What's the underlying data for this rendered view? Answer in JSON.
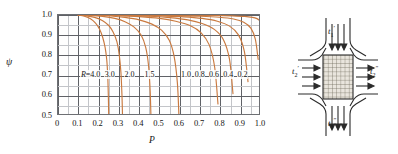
{
  "chart_data": {
    "type": "line",
    "title": "",
    "xlabel": "P",
    "ylabel": "ψ",
    "xlim": [
      0,
      1.0
    ],
    "ylim": [
      0.5,
      1.0
    ],
    "grid": true,
    "grid_major_x": 0.1,
    "grid_major_y": 0.1,
    "grid_minor_x": 0.05,
    "grid_minor_y": 0.05,
    "legend_position": "inline-curve-labels",
    "curve_color": "#c9793f",
    "x_ticks": [
      "0",
      "0.1",
      "0.2",
      "0.3",
      "0.4",
      "0.5",
      "0.6",
      "0.7",
      "0.8",
      "0.9",
      "1.0"
    ],
    "y_ticks": [
      "0.5",
      "0.6",
      "0.7",
      "0.8",
      "0.9",
      "1.0"
    ],
    "parameter_symbol": "R",
    "series": [
      {
        "name": "R=4.0",
        "label": "R=4.0",
        "label_x": 0.155,
        "label_y": 0.7,
        "x": [
          0.1,
          0.13,
          0.16,
          0.185,
          0.205,
          0.22,
          0.232,
          0.24,
          0.245,
          0.248,
          0.25
        ],
        "y": [
          1.0,
          0.994,
          0.982,
          0.96,
          0.93,
          0.89,
          0.84,
          0.78,
          0.7,
          0.6,
          0.49
        ]
      },
      {
        "name": "3.0",
        "label": "3.0",
        "label_x": 0.272,
        "label_y": 0.7,
        "x": [
          0.1,
          0.14,
          0.18,
          0.22,
          0.25,
          0.272,
          0.29,
          0.302,
          0.31,
          0.315,
          0.318
        ],
        "y": [
          1.0,
          0.996,
          0.988,
          0.972,
          0.948,
          0.915,
          0.868,
          0.8,
          0.715,
          0.605,
          0.49
        ]
      },
      {
        "name": "2.0",
        "label": "2.0",
        "label_x": 0.37,
        "label_y": 0.7,
        "x": [
          0.1,
          0.16,
          0.22,
          0.28,
          0.33,
          0.375,
          0.41,
          0.432,
          0.446,
          0.454,
          0.458
        ],
        "y": [
          1.0,
          0.998,
          0.993,
          0.983,
          0.967,
          0.94,
          0.9,
          0.84,
          0.75,
          0.625,
          0.49
        ]
      },
      {
        "name": "1.5",
        "label": "1.5",
        "label_x": 0.468,
        "label_y": 0.7,
        "x": [
          0.1,
          0.18,
          0.26,
          0.33,
          0.4,
          0.46,
          0.51,
          0.548,
          0.572,
          0.588,
          0.596
        ],
        "y": [
          1.0,
          0.999,
          0.995,
          0.988,
          0.976,
          0.956,
          0.925,
          0.875,
          0.795,
          0.665,
          0.495
        ]
      },
      {
        "name": "1.0",
        "label": "1.0",
        "label_x": 0.648,
        "label_y": 0.7,
        "x": [
          0.1,
          0.2,
          0.3,
          0.4,
          0.5,
          0.58,
          0.65,
          0.705,
          0.745,
          0.772,
          0.788
        ],
        "y": [
          1.0,
          0.999,
          0.997,
          0.992,
          0.983,
          0.969,
          0.948,
          0.912,
          0.852,
          0.74,
          0.56
        ]
      },
      {
        "name": "0.8",
        "label": "0.8",
        "label_x": 0.715,
        "label_y": 0.7,
        "x": [
          0.1,
          0.22,
          0.34,
          0.45,
          0.55,
          0.64,
          0.71,
          0.77,
          0.815,
          0.845,
          0.862
        ],
        "y": [
          1.0,
          0.999,
          0.997,
          0.994,
          0.987,
          0.976,
          0.958,
          0.929,
          0.878,
          0.78,
          0.61
        ]
      },
      {
        "name": "0.6",
        "label": "0.6",
        "label_x": 0.786,
        "label_y": 0.7,
        "x": [
          0.1,
          0.25,
          0.39,
          0.51,
          0.62,
          0.71,
          0.785,
          0.845,
          0.888,
          0.918,
          0.936
        ],
        "y": [
          1.0,
          0.999,
          0.998,
          0.995,
          0.991,
          0.983,
          0.969,
          0.945,
          0.903,
          0.82,
          0.67
        ]
      },
      {
        "name": "0.4",
        "label": "0.4",
        "label_x": 0.856,
        "label_y": 0.7,
        "x": [
          0.1,
          0.28,
          0.44,
          0.58,
          0.7,
          0.795,
          0.865,
          0.915,
          0.95,
          0.972,
          0.986
        ],
        "y": [
          1.0,
          1.0,
          0.999,
          0.997,
          0.994,
          0.989,
          0.98,
          0.964,
          0.935,
          0.88,
          0.78
        ]
      },
      {
        "name": "0.2",
        "label": "0.2",
        "label_x": 0.926,
        "label_y": 0.7,
        "x": [
          0.1,
          0.32,
          0.5,
          0.65,
          0.77,
          0.86,
          0.92,
          0.958,
          0.98,
          0.992,
          1.0
        ],
        "y": [
          1.0,
          1.0,
          1.0,
          0.999,
          0.998,
          0.996,
          0.993,
          0.988,
          0.982,
          0.974,
          0.962
        ]
      }
    ]
  },
  "diagram": {
    "name": "crossflow-heat-exchanger",
    "core_label": "finned-core-hatch",
    "streams": [
      {
        "id": "top-inlet",
        "text": "t",
        "sub": "1",
        "prime": "′",
        "x": 38,
        "y": 24
      },
      {
        "id": "left-inlet",
        "text": "t",
        "sub": "2",
        "prime": "′",
        "x": 2,
        "y": 64
      },
      {
        "id": "right-outlet",
        "text": "t",
        "sub": "2",
        "prime": "″",
        "x": 80,
        "y": 64
      },
      {
        "id": "bottom-outlet",
        "text": "t",
        "sub": "1",
        "prime": "″",
        "x": 38,
        "y": 116
      }
    ]
  }
}
